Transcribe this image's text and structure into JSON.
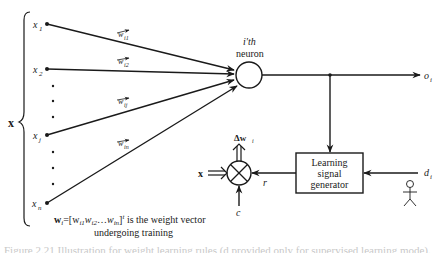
{
  "diagram": {
    "type": "neural-network-learning-rule",
    "colors": {
      "stroke": "#1a1a1a",
      "background": "#ffffff"
    },
    "input_vector": {
      "label": "x",
      "inputs": [
        {
          "id": "x1",
          "base": "x",
          "sub": "1",
          "weight": {
            "base": "w",
            "sub": "i1"
          }
        },
        {
          "id": "x2",
          "base": "x",
          "sub": "2",
          "weight": {
            "base": "w",
            "sub": "i2"
          }
        },
        {
          "id": "xj",
          "base": "x",
          "sub": "j",
          "weight": {
            "base": "w",
            "sub": "ij"
          }
        },
        {
          "id": "xn",
          "base": "x",
          "sub": "n",
          "weight": {
            "base": "w",
            "sub": "in"
          }
        }
      ],
      "ellipsis": "⋮"
    },
    "neuron": {
      "label_line1": "i'th",
      "label_line2": "neuron"
    },
    "output": {
      "base": "o",
      "sub": "i"
    },
    "weight_vector_note": {
      "line1_lhs": "w",
      "line1_lhs_sub": "i",
      "line1_formula": "=[w",
      "w1_sub": "i1",
      "w2": "w",
      "w2_sub": "i2",
      "dots": "…",
      "wn": "w",
      "wn_sub": "in",
      "close": "]",
      "transpose": "t",
      "line1_tail": " is the weight vector",
      "line2": "undergoing training"
    },
    "multiplier": {
      "input_x_label": "x",
      "delta_label": "Δw",
      "delta_sub": "i",
      "c_label": "c",
      "r_label": "r"
    },
    "learning_signal_generator": {
      "line1": "Learning",
      "line2": "signal",
      "line3": "generator"
    },
    "teacher": {
      "desired_base": "d",
      "desired_sub": "i",
      "icon": "stick-figure-teacher"
    },
    "caption_partial": "Figure 2.21  Illustration for weight learning rules (d provided only for supervised learning mode)."
  }
}
